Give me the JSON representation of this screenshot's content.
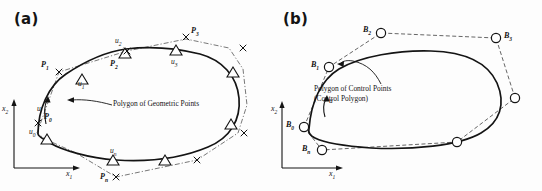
{
  "figure": {
    "background": "#fdfdfd",
    "ink": "#141414",
    "dash_color": "#3a3a3a"
  },
  "panels": [
    {
      "id": "a",
      "label": "(a)",
      "axes": {
        "x": "x",
        "x_sub": "1",
        "y": "x",
        "y_sub": "2"
      },
      "parameter_arrow": "u",
      "callout": {
        "line1": "Polygon of Geometric Points",
        "line2": ""
      },
      "marker_shape": "triangle",
      "control_marker": "cross",
      "geometric_points": [
        {
          "label": "u",
          "sub": "0",
          "x": 38,
          "y": 131
        },
        {
          "label": "u",
          "sub": "1",
          "x": 81,
          "y": 84
        },
        {
          "label": "u",
          "sub": "2",
          "x": 119,
          "y": 40
        },
        {
          "label": "u",
          "sub": "3",
          "x": 175,
          "y": 55
        },
        {
          "label": "u",
          "sub": "n",
          "x": 113,
          "y": 150
        }
      ],
      "control_points": [
        {
          "label": "P",
          "sub": "0",
          "x": 72,
          "y": 117
        },
        {
          "label": "P",
          "sub": "1",
          "x": 57,
          "y": 66
        },
        {
          "label": "P",
          "sub": "2",
          "x": 124,
          "y": 66
        },
        {
          "label": "P",
          "sub": "3",
          "x": 189,
          "y": 33
        },
        {
          "label": "P",
          "sub": "n",
          "x": 103,
          "y": 176
        }
      ]
    },
    {
      "id": "b",
      "label": "(b)",
      "axes": {
        "x": "x",
        "x_sub": "1",
        "y": "x",
        "y_sub": "2"
      },
      "parameter_arrow": "u",
      "callout": {
        "line1": "Polygon of Control Points",
        "line2": "(Control Polygon)"
      },
      "marker_shape": "circle",
      "control_marker": "circle",
      "control_points": [
        {
          "label": "B",
          "sub": "0",
          "x": 25,
          "y": 125
        },
        {
          "label": "B",
          "sub": "1",
          "x": 48,
          "y": 63
        },
        {
          "label": "B",
          "sub": "2",
          "x": 93,
          "y": 28
        },
        {
          "label": "B",
          "sub": "3",
          "x": 232,
          "y": 35
        },
        {
          "label": "B",
          "sub": "n",
          "x": 36,
          "y": 148
        }
      ]
    }
  ]
}
